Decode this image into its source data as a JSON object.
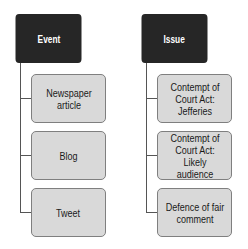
{
  "columns": [
    {
      "header": "Event",
      "children": [
        "Newspaper article",
        "Blog",
        "Tweet"
      ]
    },
    {
      "header": "Issue",
      "children": [
        "Contempt of Court Act: Jefferies",
        "Contempt of Court Act: Likely audience",
        "Defence of fair comment"
      ]
    }
  ],
  "colors": {
    "header_bg": "#262626",
    "child_bg": "#d9d9d9",
    "border": "#7f7f7f",
    "connector": "#555555"
  }
}
